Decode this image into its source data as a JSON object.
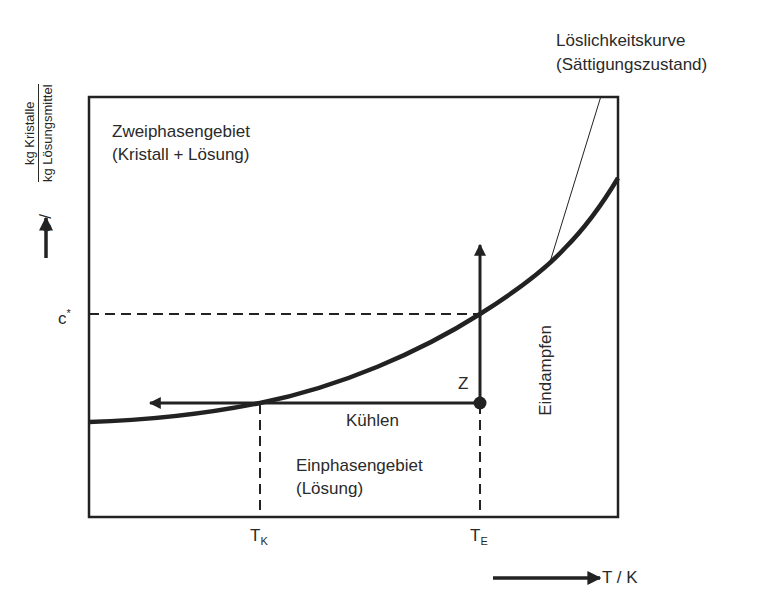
{
  "diagram": {
    "type": "solubility-phase-diagram",
    "y_axis": {
      "symbol": "c /",
      "unit_numerator": "kg Kristalle",
      "unit_denominator": "kg Lösungsmittel"
    },
    "x_axis": {
      "label": "T / K"
    },
    "ticks": {
      "c_star": "c",
      "c_star_sup": "*",
      "t_k": "T",
      "t_k_sub": "K",
      "t_e": "T",
      "t_e_sub": "E"
    },
    "regions": {
      "two_phase_line1": "Zweiphasengebiet",
      "two_phase_line2": "(Kristall + Lösung)",
      "one_phase_line1": "Einphasengebiet",
      "one_phase_line2": "(Lösung)"
    },
    "curve_label": {
      "line1": "Löslichkeitskurve",
      "line2": "(Sättigungszustand)"
    },
    "point_label": "Z",
    "process_labels": {
      "cooling": "Kühlen",
      "evaporation": "Eindampfen"
    },
    "colors": {
      "line": "#222222",
      "background": "#ffffff"
    }
  }
}
